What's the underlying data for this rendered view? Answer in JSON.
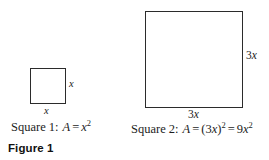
{
  "figure": {
    "number_label": "Figure 1",
    "background_color": "#ffffff",
    "stroke_color": "#2b2b2b",
    "text_color": "#1c1c1c"
  },
  "diagram_data": {
    "type": "geometry-diagram",
    "description": "Two squares compared: a small square with side x and a larger square with side 3x",
    "shapes": [
      {
        "id": "square-1",
        "name": "Square 1",
        "side_label": "x",
        "side_length_px": 36,
        "area_expression": "A = x2"
      },
      {
        "id": "square-2",
        "name": "Square 2",
        "side_label": "3x",
        "side_length_px": 98,
        "area_expression": "A = (3x)2 = 9x2"
      }
    ]
  },
  "square_small": {
    "side_label_right": "x",
    "side_label_bottom": "x",
    "caption": {
      "lead": "Square 1:",
      "variable": "A",
      "equals": "=",
      "base": "x",
      "exponent": "2"
    }
  },
  "square_large": {
    "side_label_right_number": "3",
    "side_label_right_variable": "x",
    "side_label_bottom_number": "3",
    "side_label_bottom_variable": "x",
    "caption": {
      "lead": "Square 2:",
      "variable": "A",
      "equals_first": "=",
      "open_paren": "(",
      "coefficient": "3",
      "base": "x",
      "close_paren": ")",
      "exponent_first": "2",
      "equals_second": "=",
      "coefficient_second": "9",
      "base_second": "x",
      "exponent_second": "2"
    }
  }
}
